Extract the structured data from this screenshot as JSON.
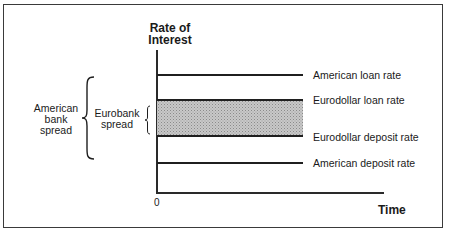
{
  "diagram": {
    "y_axis_label_line1": "Rate of",
    "y_axis_label_line2": "Interest",
    "x_axis_label": "Time",
    "origin_label": "0",
    "rates": [
      {
        "label": "American loan rate",
        "order": 1
      },
      {
        "label": "Eurodollar loan rate",
        "order": 2
      },
      {
        "label": "Eurodollar deposit rate",
        "order": 3
      },
      {
        "label": "American deposit rate",
        "order": 4
      }
    ],
    "spreads": {
      "american": {
        "line1": "American",
        "line2": "bank",
        "line3": "spread",
        "spans": "American loan rate to American deposit rate"
      },
      "eurobank": {
        "line1": "Eurobank",
        "line2": "spread",
        "spans": "Eurodollar loan rate to Eurodollar deposit rate"
      }
    },
    "colors": {
      "line": "#1f1f1f",
      "band_fill": "#c8c8c8",
      "frame": "#3a3a3a"
    }
  }
}
